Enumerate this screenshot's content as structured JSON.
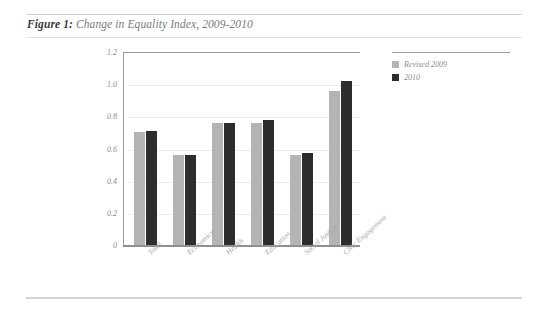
{
  "figure": {
    "label": "Figure 1:",
    "title": "Change in Equality Index, 2009-2010"
  },
  "colors": {
    "series_2009": "#b4b4b4",
    "series_2010": "#2d2d2d",
    "rule": "#cfcfcf",
    "axis": "#9a9a9a",
    "gridline": "#ededed",
    "tick_text": "#8a8a8a",
    "label_text": "#a8a8a8"
  },
  "chart_data": {
    "type": "bar",
    "title": "Change in Equality Index, 2009-2010",
    "xlabel": "",
    "ylabel": "",
    "ylim": [
      0,
      1.2
    ],
    "yticks": [
      1.2,
      1.0,
      0.8,
      0.6,
      0.4,
      0.2,
      0
    ],
    "ytick_labels": [
      "1.2",
      "1.0",
      "0.8",
      "0.6",
      "0.4",
      "0.2",
      "0"
    ],
    "grid": true,
    "legend_position": "top-right",
    "categories": [
      "Total",
      "Economics",
      "Health",
      "Education",
      "Social Justice",
      "Civic Engagement"
    ],
    "series": [
      {
        "name": "Revised 2009",
        "color": "#b4b4b4",
        "values": [
          0.7,
          0.56,
          0.76,
          0.76,
          0.56,
          0.96
        ]
      },
      {
        "name": "2010",
        "color": "#2d2d2d",
        "values": [
          0.71,
          0.56,
          0.76,
          0.78,
          0.57,
          1.02
        ]
      }
    ]
  }
}
